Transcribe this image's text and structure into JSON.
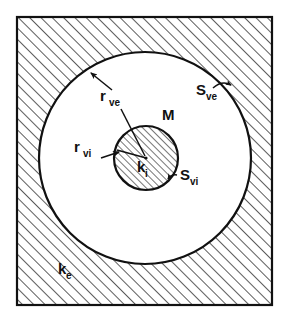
{
  "figure": {
    "background_color": "#ffffff",
    "line_color": "#111111",
    "hatch_color": "#333333",
    "clear_region_color": "#ffffff"
  },
  "frame": {
    "name": "outer-square-boundary",
    "x": 17,
    "y": 17,
    "width": 255,
    "height": 288,
    "stroke_width": 2.2
  },
  "outer_circle": {
    "name": "outer-interface-circle",
    "cx": 145,
    "cy": 158,
    "r": 106,
    "stroke_width": 2.2,
    "fill": "#ffffff"
  },
  "inner_circle": {
    "name": "inner-inclusion-circle",
    "cx": 146,
    "cy": 158,
    "r": 32,
    "stroke_width": 2.2,
    "hatched": true
  },
  "hatching": {
    "outer_region_spacing": 8,
    "inner_region_spacing": 5,
    "angle_degrees": 45,
    "direction": "forward-slash"
  },
  "labels": {
    "r_ve": {
      "base": "r",
      "sub": "ve",
      "x": 100,
      "y": 101,
      "description": "radius to the external volume interface"
    },
    "r_vi": {
      "base": "r",
      "sub": "vi",
      "x": 85,
      "y": 152,
      "description": "radius to the internal volume interface"
    },
    "S_ve": {
      "base": "S",
      "sub": "ve",
      "x": 197,
      "y": 95,
      "description": "external volume surface"
    },
    "S_vi": {
      "base": "S",
      "sub": "vi",
      "x": 176,
      "y": 180,
      "description": "internal volume surface"
    },
    "k_i": {
      "base": "k",
      "sub": "i",
      "x": 136,
      "y": 172,
      "description": "internal conductivity of the inclusion"
    },
    "k_e": {
      "base": "k",
      "sub": "e",
      "x": 59,
      "y": 274,
      "description": "external conductivity of the surrounding medium"
    },
    "M": {
      "base": "M",
      "sub": "",
      "x": 163,
      "y": 120,
      "description": "matrix / inclusion marker"
    }
  },
  "leaders": {
    "r_ve_arrow": {
      "name": "r-ve-leader-arrow",
      "from_x": 112,
      "from_y": 90,
      "to_x": 89,
      "to_y": 71,
      "description": "arrow from r_ve label to the outer circle boundary"
    },
    "r_ve_line": {
      "name": "r-ve-radius-line",
      "from_x": 120,
      "from_y": 108,
      "to_x": 146,
      "to_y": 158,
      "description": "radius line from r_ve label to the common centre"
    },
    "r_vi_arrow": {
      "name": "r-vi-leader-arrow",
      "from_x": 101,
      "from_y": 157,
      "to_x": 118,
      "to_y": 152,
      "description": "arrow from r_vi label to the inner circle boundary"
    },
    "r_vi_line": {
      "name": "r-vi-radius-line",
      "from_x": 116,
      "from_y": 151,
      "to_x": 146,
      "to_y": 158,
      "description": "radius line from the inner boundary to the common centre"
    },
    "S_ve_arrow": {
      "name": "s-ve-leader-arrow",
      "from_x": 214,
      "from_y": 88,
      "to_x": 232,
      "to_y": 84,
      "description": "curved arrow from S_ve label to the outer circle arc"
    },
    "S_vi_arrow": {
      "name": "s-vi-leader-arrow",
      "from_x": 176,
      "from_y": 176,
      "to_x": 166,
      "to_y": 180,
      "description": "curved arrow from S_vi label to the inner circle arc"
    }
  }
}
